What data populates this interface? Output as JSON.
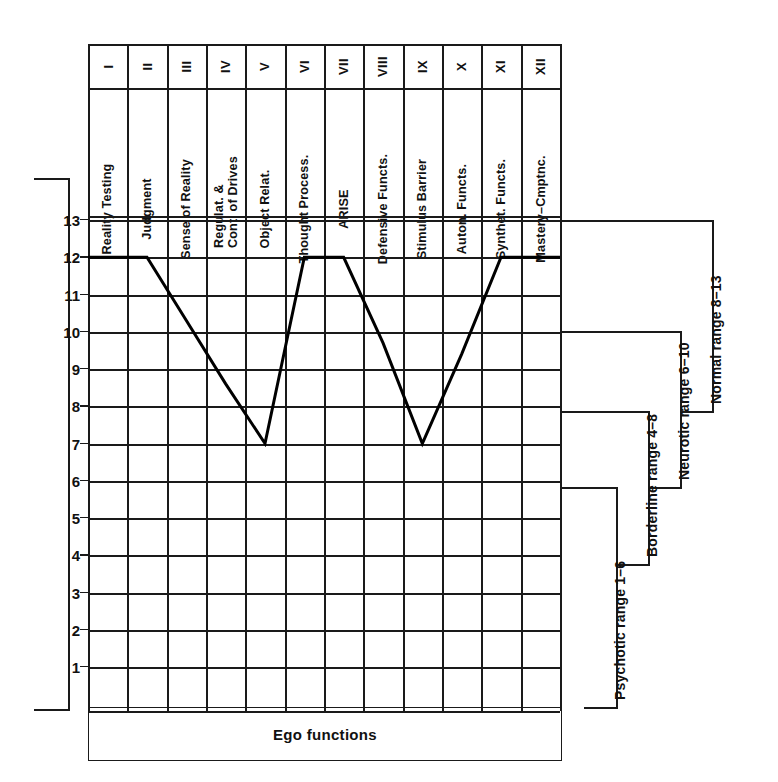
{
  "figure": {
    "bottom_axis_label": "Ego functions"
  },
  "columns": [
    {
      "roman": "I",
      "name": "Reality Testing",
      "name_lines": [
        "Reality Testing"
      ]
    },
    {
      "roman": "II",
      "name": "Judgment",
      "name_lines": [
        "Judgment"
      ]
    },
    {
      "roman": "III",
      "name": "Sense of Reality",
      "name_lines": [
        "Sense of Reality"
      ]
    },
    {
      "roman": "IV",
      "name": "Regulat. & Cont. of Drives",
      "name_lines": [
        "Regulat. &",
        "Cont. of Drives"
      ]
    },
    {
      "roman": "V",
      "name": "Object Relat.",
      "name_lines": [
        "Object Relat."
      ]
    },
    {
      "roman": "VI",
      "name": "Thought Process.",
      "name_lines": [
        "Thought Process."
      ]
    },
    {
      "roman": "VII",
      "name": "ARISE",
      "name_lines": [
        "ARISE"
      ]
    },
    {
      "roman": "VIII",
      "name": "Defensive Functs.",
      "name_lines": [
        "Defensive Functs."
      ]
    },
    {
      "roman": "IX",
      "name": "Stimulus Barrier",
      "name_lines": [
        "Stimulus Barrier"
      ]
    },
    {
      "roman": "X",
      "name": "Auton. Functs.",
      "name_lines": [
        "Auton. Functs."
      ]
    },
    {
      "roman": "XI",
      "name": "Synthet. Functs.",
      "name_lines": [
        "Synthet. Functs."
      ]
    },
    {
      "roman": "XII",
      "name": "Mastery–Cmptnc.",
      "name_lines": [
        "Mastery–Cmptnc."
      ]
    }
  ],
  "y_ticks": [
    "13",
    "12",
    "11",
    "10",
    "9",
    "8",
    "7",
    "6",
    "5",
    "4",
    "3",
    "2",
    "1"
  ],
  "brackets": [
    {
      "id": "normal",
      "label": "Normal range 8–13"
    },
    {
      "id": "neurotic",
      "label": "Neurotic range 6–10"
    },
    {
      "id": "borderline",
      "label": "Borderline range 4–8"
    },
    {
      "id": "psychotic",
      "label": "Psychotic range 1–6"
    }
  ],
  "chart_data": {
    "type": "line",
    "title": "",
    "xlabel": "Ego functions",
    "ylabel": "",
    "ylim": [
      1,
      13
    ],
    "grid": true,
    "legend": "none",
    "categories": [
      "I",
      "II",
      "III",
      "IV",
      "V",
      "VI",
      "VII",
      "VIII",
      "IX",
      "X",
      "XI",
      "XII"
    ],
    "category_names": [
      "Reality Testing",
      "Judgment",
      "Sense of Reality",
      "Regulat. & Cont. of Drives",
      "Object Relat.",
      "Thought Process.",
      "ARISE",
      "Defensive Functs.",
      "Stimulus Barrier",
      "Auton. Functs.",
      "Synthet. Functs.",
      "Mastery–Cmptnc."
    ],
    "values": [
      12,
      12,
      10.3,
      8.6,
      7,
      12,
      12,
      9.7,
      7,
      9.4,
      12,
      12
    ],
    "yticklabels": [
      "13",
      "12",
      "11",
      "10",
      "9",
      "8",
      "7",
      "6",
      "5",
      "4",
      "3",
      "2",
      "1"
    ],
    "annotations": [
      {
        "text": "Normal range 8–13",
        "range": [
          8,
          13
        ]
      },
      {
        "text": "Neurotic range 6–10",
        "range": [
          6,
          10
        ]
      },
      {
        "text": "Borderline range 4–8",
        "range": [
          4,
          8
        ]
      },
      {
        "text": "Psychotic range 1–6",
        "range": [
          1,
          6
        ]
      }
    ]
  }
}
